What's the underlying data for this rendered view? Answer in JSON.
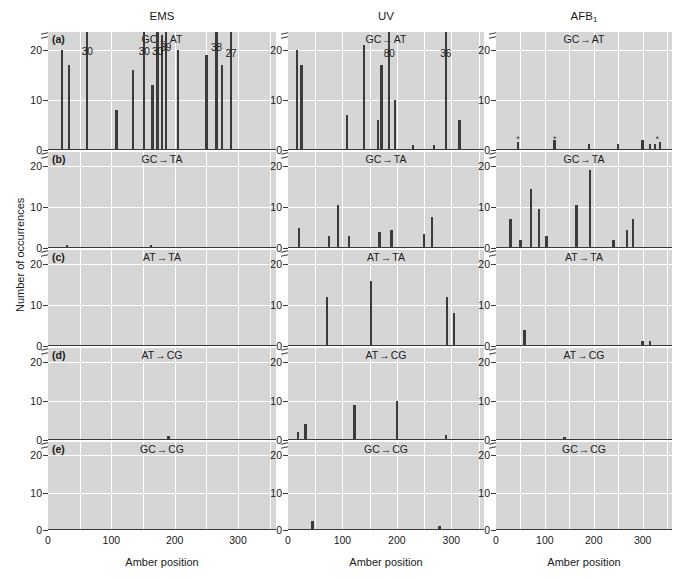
{
  "figure": {
    "y_axis_title": "Number of occurrences",
    "x_axis_title": "Amber position",
    "columns": [
      {
        "key": "ems",
        "title": "EMS",
        "subscript": ""
      },
      {
        "key": "uv",
        "title": "UV",
        "subscript": ""
      },
      {
        "key": "afb1",
        "title": "AFB",
        "subscript": "1"
      }
    ],
    "rows": [
      {
        "letter": "(a)",
        "from": "GC",
        "to": "AT"
      },
      {
        "letter": "(b)",
        "from": "GC",
        "to": "TA"
      },
      {
        "letter": "(c)",
        "from": "AT",
        "to": "TA"
      },
      {
        "letter": "(d)",
        "from": "AT",
        "to": "CG"
      },
      {
        "letter": "(e)",
        "from": "GC",
        "to": "CG"
      }
    ],
    "y_ticks": [
      "0",
      "10",
      "20"
    ],
    "x_ticks": [
      "0",
      "100",
      "200",
      "300"
    ],
    "arrow_glyph": "→",
    "axis_break_note": "break above 20",
    "colors": {
      "panel_background": "#d6d6d6",
      "gridline": "#ffffff",
      "bar": "#3b3b3b",
      "axis": "#3a3a3a",
      "text": "#1a1a1a",
      "page_background": "#ffffff"
    }
  },
  "chart_data": {
    "type": "bar",
    "xlabel": "Amber position",
    "ylabel": "Number of occurrences",
    "xlim": [
      0,
      360
    ],
    "ylim": [
      0,
      24
    ],
    "y_axis_broken_above": 23,
    "grid": true,
    "legend": "none",
    "panels": [
      {
        "id": "a-ems",
        "column": "EMS",
        "row": "(a)",
        "mutation": "GC → AT",
        "annotations": [
          {
            "x": 62,
            "value": 30,
            "label": "30"
          },
          {
            "x": 152,
            "value": 30,
            "label": "30"
          },
          {
            "x": 173,
            "value": 30,
            "label": "30"
          },
          {
            "x": 186,
            "value": 39,
            "label": "39"
          },
          {
            "x": 266,
            "value": 38,
            "label": "38"
          },
          {
            "x": 289,
            "value": 27,
            "label": "27"
          }
        ],
        "x": [
          22,
          33,
          62,
          108,
          134,
          152,
          165,
          173,
          180,
          186,
          205,
          250,
          266,
          275,
          289
        ],
        "y": [
          20,
          17,
          30,
          8,
          16,
          30,
          13,
          30,
          23,
          39,
          20,
          19,
          38,
          17,
          27
        ]
      },
      {
        "id": "a-uv",
        "column": "UV",
        "row": "(a)",
        "mutation": "GC → AT",
        "annotations": [
          {
            "x": 186,
            "value": 80,
            "label": "80"
          },
          {
            "x": 290,
            "value": 36,
            "label": "36"
          }
        ],
        "x": [
          17,
          25,
          108,
          140,
          165,
          172,
          186,
          196,
          230,
          268,
          290,
          315
        ],
        "y": [
          20,
          17,
          7,
          21,
          6,
          17,
          80,
          10,
          1,
          1,
          36,
          6
        ]
      },
      {
        "id": "a-afb1",
        "column": "AFB1",
        "row": "(a)",
        "mutation": "GC → AT",
        "annotations": [],
        "stars": [
          45,
          120,
          330
        ],
        "x": [
          45,
          120,
          190,
          250,
          300,
          315,
          325,
          335
        ],
        "y": [
          1.5,
          2,
          1.2,
          1.2,
          2,
          1.2,
          1.2,
          1.5
        ]
      },
      {
        "id": "b-ems",
        "column": "EMS",
        "row": "(b)",
        "mutation": "GC → TA",
        "annotations": [],
        "x": [
          30,
          163
        ],
        "y": [
          0.8,
          0.8
        ]
      },
      {
        "id": "b-uv",
        "column": "UV",
        "row": "(b)",
        "mutation": "GC → TA",
        "annotations": [],
        "x": [
          20,
          75,
          92,
          112,
          168,
          190,
          250,
          265
        ],
        "y": [
          5,
          3,
          10.5,
          3,
          4,
          4.5,
          3.5,
          7.5
        ]
      },
      {
        "id": "b-afb1",
        "column": "AFB1",
        "row": "(b)",
        "mutation": "GC → TA",
        "annotations": [],
        "x": [
          30,
          50,
          72,
          88,
          103,
          165,
          192,
          240,
          268,
          280
        ],
        "y": [
          7,
          2,
          14.5,
          9.5,
          3,
          10.5,
          19,
          2,
          4.5,
          7
        ]
      },
      {
        "id": "c-ems",
        "column": "EMS",
        "row": "(c)",
        "mutation": "AT → TA",
        "annotations": [],
        "x": [],
        "y": []
      },
      {
        "id": "c-uv",
        "column": "UV",
        "row": "(c)",
        "mutation": "AT → TA",
        "annotations": [],
        "x": [
          72,
          152,
          292,
          305
        ],
        "y": [
          12,
          16,
          12,
          8
        ]
      },
      {
        "id": "c-afb1",
        "column": "AFB1",
        "row": "(c)",
        "mutation": "AT → TA",
        "annotations": [],
        "x": [
          58,
          300,
          315
        ],
        "y": [
          4,
          1.2,
          1.2
        ]
      },
      {
        "id": "d-ems",
        "column": "EMS",
        "row": "(d)",
        "mutation": "AT → CG",
        "annotations": [],
        "x": [
          190
        ],
        "y": [
          1
        ]
      },
      {
        "id": "d-uv",
        "column": "UV",
        "row": "(d)",
        "mutation": "AT → CG",
        "annotations": [],
        "x": [
          18,
          32,
          122,
          200,
          290
        ],
        "y": [
          2,
          4,
          9,
          10,
          1.2
        ]
      },
      {
        "id": "d-afb1",
        "column": "AFB1",
        "row": "(d)",
        "mutation": "AT → CG",
        "annotations": [],
        "x": [
          140
        ],
        "y": [
          0.8
        ]
      },
      {
        "id": "e-ems",
        "column": "EMS",
        "row": "(e)",
        "mutation": "GC → CG",
        "annotations": [],
        "x": [],
        "y": []
      },
      {
        "id": "e-uv",
        "column": "UV",
        "row": "(e)",
        "mutation": "GC → CG",
        "annotations": [],
        "x": [
          45,
          278
        ],
        "y": [
          2.5,
          1
        ]
      },
      {
        "id": "e-afb1",
        "column": "AFB1",
        "row": "(e)",
        "mutation": "GC → CG",
        "annotations": [],
        "x": [],
        "y": []
      }
    ]
  }
}
